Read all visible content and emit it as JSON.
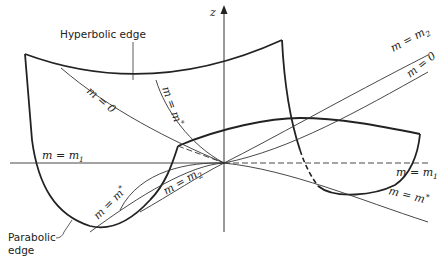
{
  "figure": {
    "axis_label": "z",
    "annotations": {
      "hyperbolic_edge": "Hyperbolic edge",
      "parabolic_edge_line1": "Parabolic",
      "parabolic_edge_line2": "edge"
    },
    "curve_labels": {
      "m_zero_left": "m = 0",
      "m_star_upper": "m = m",
      "m_star_upper_sup": "*",
      "m_m2_right": "m = m",
      "m_m2_right_sub": "2",
      "m_zero_right": "m = 0",
      "m_m1_left": "m = m",
      "m_m1_left_sub": "1",
      "m_m1_right": "m = m",
      "m_m1_right_sub": "1",
      "m_m2_lower": "m = m",
      "m_m2_lower_sub": "2",
      "m_star_lower_left": "m = m",
      "m_star_lower_left_sup": "*",
      "m_star_lower_right": "m = m",
      "m_star_lower_right_sup": "*"
    }
  }
}
